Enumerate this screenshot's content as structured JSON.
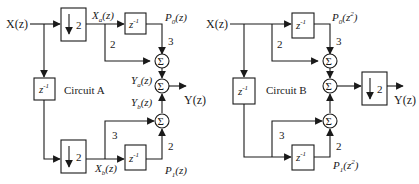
{
  "circuit_a": {
    "title": "Circuit A",
    "input": "X(z)",
    "output": "Y(z)",
    "downsample_top": "2",
    "downsample_bottom": "2",
    "delay_left": "z",
    "delay_exp": "-1",
    "delay_top": "z",
    "delay_bottom": "z",
    "xa": "X",
    "xa_sub": "a",
    "xa_arg": "(z)",
    "xb": "X",
    "xb_sub": "b",
    "xb_arg": "(z)",
    "p0": "P",
    "p0_sub": "0",
    "p0_arg": "(z)",
    "p1": "P",
    "p1_sub": "1",
    "p1_arg": "(z)",
    "ya": "Y",
    "ya_sub": "a",
    "ya_arg": "(z)",
    "yb": "Y",
    "yb_sub": "b",
    "yb_arg": "(z)",
    "gain_top_direct": "2",
    "gain_top_delayed": "3",
    "gain_bottom_direct": "3",
    "gain_bottom_delayed": "2",
    "sum_symbol": "Σ"
  },
  "circuit_b": {
    "title": "Circuit B",
    "input": "X(z)",
    "output": "Y(z)",
    "downsample": "2",
    "delay_left": "z",
    "delay_exp": "-1",
    "delay_top": "z",
    "delay_bottom": "z",
    "p0": "P",
    "p0_sub": "0",
    "p0_arg_open": "(z",
    "p0_arg_exp": "2",
    "p0_arg_close": ")",
    "p1": "P",
    "p1_sub": "1",
    "p1_arg_open": "(z",
    "p1_arg_exp": "2",
    "p1_arg_close": ")",
    "gain_top_direct": "2",
    "gain_top_delayed": "3",
    "gain_bottom_direct": "3",
    "gain_bottom_delayed": "2",
    "sum_symbol": "Σ"
  }
}
